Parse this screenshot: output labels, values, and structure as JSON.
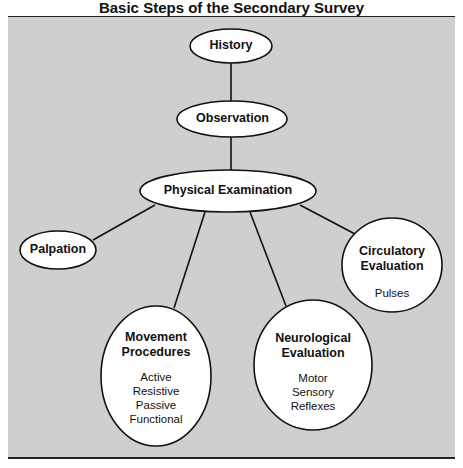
{
  "title": "Basic Steps of the Secondary Survey",
  "colors": {
    "panel": "#cfcfcf",
    "node_fill": "#ffffff",
    "stroke": "#111111",
    "text": "#111111"
  },
  "nodes": {
    "history": {
      "label": "History"
    },
    "observation": {
      "label": "Observation"
    },
    "physical": {
      "label": "Physical Examination"
    },
    "palpation": {
      "label": "Palpation"
    },
    "movement": {
      "label_line1": "Movement",
      "label_line2": "Procedures",
      "items": [
        "Active",
        "Resistive",
        "Passive",
        "Functional"
      ]
    },
    "neurological": {
      "label_line1": "Neurological",
      "label_line2": "Evaluation",
      "items": [
        "Motor",
        "Sensory",
        "Reflexes"
      ]
    },
    "circulatory": {
      "label_line1": "Circulatory",
      "label_line2": "Evaluation",
      "items": [
        "Pulses"
      ]
    }
  },
  "edges": [
    [
      "history",
      "observation"
    ],
    [
      "observation",
      "physical"
    ],
    [
      "physical",
      "palpation"
    ],
    [
      "physical",
      "movement"
    ],
    [
      "physical",
      "neurological"
    ],
    [
      "physical",
      "circulatory"
    ]
  ]
}
